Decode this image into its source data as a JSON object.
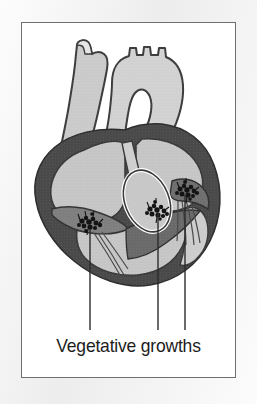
{
  "figure": {
    "caption": "Vegetative growths",
    "panel": {
      "background_color": "#ffffff",
      "border_color": "#6f6f6f"
    },
    "page_background_color": "#f0f0f0",
    "palette": {
      "myocardium_dark": "#4a4a4a",
      "chamber_light": "#c9c9c9",
      "vessel_light": "#cfcfcf",
      "valve_mid": "#8d8d8d",
      "vegetation_dark": "#1a1a1a",
      "outline": "#3d3d3d",
      "leader_line": "#2b2b2b"
    },
    "labels": [
      {
        "name": "leader-line-left",
        "target": "tricuspid-valve-vegetation",
        "x": 68,
        "y_top": 206,
        "y_bottom": 307
      },
      {
        "name": "leader-line-middle",
        "target": "aortic-valve-vegetation",
        "x": 136,
        "y_top": 190,
        "y_bottom": 307
      },
      {
        "name": "leader-line-right",
        "target": "mitral-valve-vegetation",
        "x": 163,
        "y_top": 172,
        "y_bottom": 307
      }
    ],
    "anatomy": [
      {
        "name": "superior-vena-cava",
        "tone": "vessel_light"
      },
      {
        "name": "aortic-arch",
        "tone": "vessel_light"
      },
      {
        "name": "right-atrium",
        "tone": "chamber_light"
      },
      {
        "name": "left-atrium",
        "tone": "chamber_light"
      },
      {
        "name": "left-ventricle",
        "tone": "chamber_light"
      },
      {
        "name": "right-ventricle",
        "tone": "chamber_light"
      },
      {
        "name": "myocardium-wall",
        "tone": "myocardium_dark"
      },
      {
        "name": "valve-annulus-ellipse",
        "tone": "chamber_light"
      },
      {
        "name": "chordae-tendineae",
        "tone": "outline"
      }
    ],
    "vegetations": [
      {
        "name": "vegetation-left",
        "cx": 68,
        "cy": 203
      },
      {
        "name": "vegetation-middle",
        "cx": 137,
        "cy": 187
      },
      {
        "name": "vegetation-right",
        "cx": 167,
        "cy": 168
      }
    ]
  }
}
